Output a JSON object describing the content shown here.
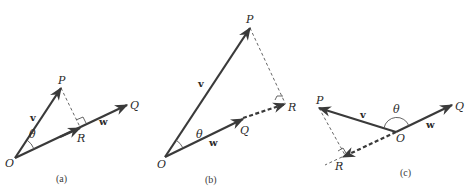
{
  "figure": {
    "colors": {
      "line": "#3a3a3a",
      "background": "#ffffff"
    },
    "panels": [
      {
        "caption": "(a)",
        "points": {
          "O": "O",
          "P": "P",
          "Q": "Q",
          "R": "R"
        },
        "vectors": {
          "v": "v",
          "w": "w"
        },
        "angle": "θ",
        "description": "Acute angle: projection R of P lies on segment OQ"
      },
      {
        "caption": "(b)",
        "points": {
          "O": "O",
          "P": "P",
          "Q": "Q",
          "R": "R"
        },
        "vectors": {
          "v": "v",
          "w": "w"
        },
        "angle": "θ",
        "description": "Acute angle: projection R lies beyond Q on extension of OQ (dashed)"
      },
      {
        "caption": "(c)",
        "points": {
          "O": "O",
          "P": "P",
          "Q": "Q",
          "R": "R"
        },
        "vectors": {
          "v": "v",
          "w": "w"
        },
        "angle": "θ",
        "description": "Obtuse angle: projection R lies on extension of QO past O (dashed)"
      }
    ]
  }
}
